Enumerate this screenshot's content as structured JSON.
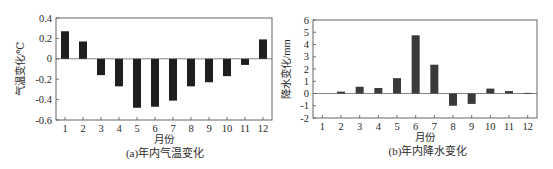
{
  "chart_data": [
    {
      "type": "bar",
      "title": "(a)年内气温变化",
      "xlabel": "月份",
      "ylabel": "气温变化/℃",
      "categories": [
        "1",
        "2",
        "3",
        "4",
        "5",
        "6",
        "7",
        "8",
        "9",
        "10",
        "11",
        "12"
      ],
      "values": [
        0.27,
        0.17,
        -0.16,
        -0.27,
        -0.48,
        -0.47,
        -0.41,
        -0.27,
        -0.23,
        -0.17,
        -0.06,
        0.19
      ],
      "ylim": [
        -0.6,
        0.4
      ],
      "yticks": [
        "0.4",
        "0.2",
        "0",
        "-0.2",
        "-0.4",
        "-0.6"
      ],
      "ytick_values": [
        0.4,
        0.2,
        0,
        -0.2,
        -0.4,
        -0.6
      ],
      "grid": false,
      "legend": null,
      "bar_color": "#1e1e1e"
    },
    {
      "type": "bar",
      "title": "(b)年内降水变化",
      "xlabel": "月份",
      "ylabel": "降水变化/mm",
      "categories": [
        "1",
        "2",
        "3",
        "4",
        "5",
        "6",
        "7",
        "8",
        "9",
        "10",
        "11",
        "12"
      ],
      "values": [
        0,
        0.15,
        0.55,
        0.45,
        1.25,
        4.75,
        2.35,
        -1.0,
        -0.85,
        0.4,
        0.2,
        0.05
      ],
      "ylim": [
        -2,
        6
      ],
      "yticks": [
        "6",
        "5",
        "4",
        "3",
        "2",
        "1",
        "0",
        "-1",
        "-2"
      ],
      "ytick_values": [
        6,
        5,
        4,
        3,
        2,
        1,
        0,
        -1,
        -2
      ],
      "grid": false,
      "legend": null,
      "bar_color": "#3a3a3a"
    }
  ]
}
